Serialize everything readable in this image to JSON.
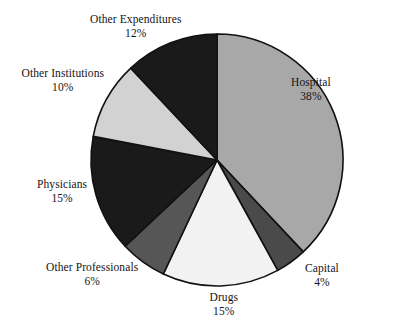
{
  "chart_data": {
    "type": "pie",
    "title": "",
    "subtitle": "",
    "xlabel": "",
    "ylabel": "",
    "legend_position": "none",
    "grid": false,
    "value_unit": "%",
    "start_angle_deg": 0,
    "direction": "clockwise",
    "categories": [
      "Hospital",
      "Capital",
      "Drugs",
      "Other Professionals",
      "Physicians",
      "Other Institutions",
      "Other Expenditures"
    ],
    "values": [
      38,
      4,
      15,
      6,
      15,
      10,
      12
    ],
    "slices": [
      {
        "label": "Hospital",
        "value": 38,
        "value_text": "38%",
        "color": "#a8a8a8",
        "label_x": 311,
        "label_y": 76
      },
      {
        "label": "Capital",
        "value": 4,
        "value_text": "4%",
        "color": "#4a4a4a",
        "label_x": 322,
        "label_y": 262
      },
      {
        "label": "Drugs",
        "value": 15,
        "value_text": "15%",
        "color": "#f2f2f2",
        "label_x": 224,
        "label_y": 291
      },
      {
        "label": "Other Professionals",
        "value": 6,
        "value_text": "6%",
        "color": "#565656",
        "label_x": 92,
        "label_y": 261
      },
      {
        "label": "Physicians",
        "value": 15,
        "value_text": "15%",
        "color": "#1a1a1a",
        "label_x": 62,
        "label_y": 178
      },
      {
        "label": "Other Institutions",
        "value": 10,
        "value_text": "10%",
        "color": "#d2d2d2",
        "label_x": 63,
        "label_y": 67
      },
      {
        "label": "Other Expenditures",
        "value": 12,
        "value_text": "12%",
        "color": "#1a1a1a",
        "label_x": 136,
        "label_y": 13
      }
    ],
    "geometry": {
      "center_x": 217,
      "center_y": 160,
      "radius": 126
    },
    "outline_color": "#111111",
    "background_color": "#ffffff"
  }
}
